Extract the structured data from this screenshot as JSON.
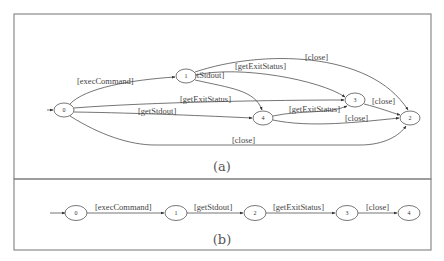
{
  "figure": {
    "panel_a": {
      "caption": "(a)",
      "nodes": [
        {
          "id": "0",
          "label": "0"
        },
        {
          "id": "1",
          "label": "1"
        },
        {
          "id": "2",
          "label": "2"
        },
        {
          "id": "3",
          "label": "3"
        },
        {
          "id": "4",
          "label": "4"
        }
      ],
      "edges": [
        {
          "from": "0",
          "to": "1",
          "label": "[execCommand]"
        },
        {
          "from": "1",
          "to": "4",
          "label": "[getStdout]"
        },
        {
          "from": "1",
          "to": "3",
          "label": "[getExitStatus]"
        },
        {
          "from": "1",
          "to": "2",
          "label": "[close]"
        },
        {
          "from": "0",
          "to": "3",
          "label": "[getExitStatus]"
        },
        {
          "from": "0",
          "to": "4",
          "label": "[getStdout]"
        },
        {
          "from": "0",
          "to": "2",
          "label": "[close]"
        },
        {
          "from": "4",
          "to": "3",
          "label": "[getExitStatus]"
        },
        {
          "from": "4",
          "to": "2",
          "label": "[close]"
        },
        {
          "from": "3",
          "to": "2",
          "label": "[close]"
        }
      ]
    },
    "panel_b": {
      "caption": "(b)",
      "nodes": [
        {
          "id": "0",
          "label": "0"
        },
        {
          "id": "1",
          "label": "1"
        },
        {
          "id": "2",
          "label": "2"
        },
        {
          "id": "3",
          "label": "3"
        },
        {
          "id": "4",
          "label": "4"
        }
      ],
      "edges": [
        {
          "from": "0",
          "to": "1",
          "label": "[execCommand]"
        },
        {
          "from": "1",
          "to": "2",
          "label": "[getStdout]"
        },
        {
          "from": "2",
          "to": "3",
          "label": "[getExitStatus]"
        },
        {
          "from": "3",
          "to": "4",
          "label": "[close]"
        }
      ]
    }
  }
}
